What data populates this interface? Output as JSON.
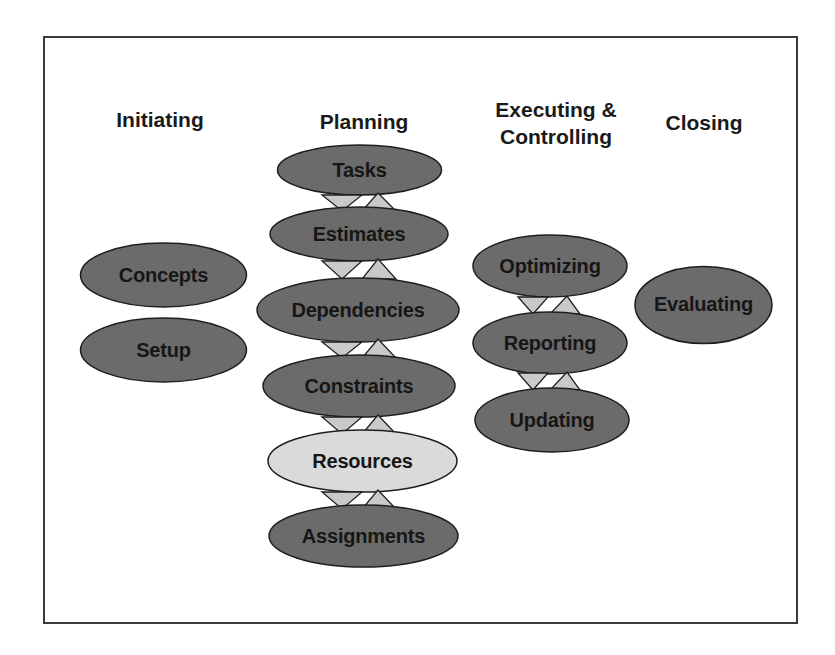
{
  "colors": {
    "frame_border": "#3a3a3a",
    "node_fill_dark": "#6b6b6b",
    "node_fill_highlight": "#dadada",
    "node_stroke": "#1e1e1e",
    "arrow_fill": "#c9c9c9",
    "text": "#1a1a1a"
  },
  "phases": [
    {
      "id": "initiating",
      "title_lines": [
        "Initiating"
      ],
      "nodes": [
        {
          "label": "Concepts",
          "highlight": false
        },
        {
          "label": "Setup",
          "highlight": false
        }
      ]
    },
    {
      "id": "planning",
      "title_lines": [
        "Planning"
      ],
      "nodes": [
        {
          "label": "Tasks",
          "highlight": false
        },
        {
          "label": "Estimates",
          "highlight": false
        },
        {
          "label": "Dependencies",
          "highlight": false
        },
        {
          "label": "Constraints",
          "highlight": false
        },
        {
          "label": "Resources",
          "highlight": true
        },
        {
          "label": "Assignments",
          "highlight": false
        }
      ]
    },
    {
      "id": "executing-controlling",
      "title_lines": [
        "Executing &",
        "Controlling"
      ],
      "nodes": [
        {
          "label": "Optimizing",
          "highlight": false
        },
        {
          "label": "Reporting",
          "highlight": false
        },
        {
          "label": "Updating",
          "highlight": false
        }
      ]
    },
    {
      "id": "closing",
      "title_lines": [
        "Closing"
      ],
      "nodes": [
        {
          "label": "Evaluating",
          "highlight": false
        }
      ]
    }
  ],
  "connectors": {
    "style": "bidirectional-triangle-pair",
    "planning": [
      "Tasks-Estimates",
      "Estimates-Dependencies",
      "Dependencies-Constraints",
      "Constraints-Resources",
      "Resources-Assignments"
    ],
    "executing-controlling": [
      "Optimizing-Reporting",
      "Reporting-Updating"
    ]
  }
}
